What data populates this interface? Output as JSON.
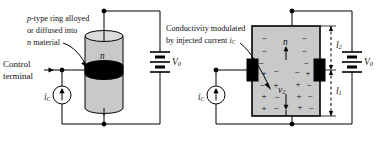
{
  "figure": {
    "type": "semiconductor-device-diagram",
    "background": "#ffffff",
    "stroke": "#000000",
    "body_fill": "#c9c9c9",
    "electrode_fill": "#000000"
  },
  "left_diagram": {
    "name": "three-dimensional-device-view",
    "annotation": {
      "line1": "p-type ring alloyed",
      "line2": "or diffused into",
      "line3": "n material",
      "italic_lead_1": "p",
      "italic_lead_3": "n"
    },
    "control_terminal": {
      "line1": "Control",
      "line2": "terminal"
    },
    "current_source_label": "i",
    "current_source_sub": "C",
    "body_label": "n",
    "battery_label": "V",
    "battery_sub": "0"
  },
  "right_diagram": {
    "name": "cross-section-device-view",
    "annotation": {
      "line1": "Conductivity modulated",
      "line2_text": "by injected current",
      "line2_symbol": "i",
      "line2_sub": "C"
    },
    "body_label": "n",
    "inner_label": "v",
    "inner_label_sub": "2",
    "current_source_label": "i",
    "current_source_sub": "C",
    "battery_label": "V",
    "battery_sub": "0",
    "dimension_upper": "l",
    "dimension_upper_sub": "2",
    "dimension_lower": "l",
    "dimension_lower_sub": "1",
    "charges_upper_region": [
      "-",
      "-",
      "-",
      "-",
      "-",
      "-"
    ],
    "charges_lower_region": [
      "+",
      "-",
      "+",
      "-",
      "+",
      "-",
      "+",
      "-",
      "+",
      "-",
      "+",
      "-"
    ]
  }
}
